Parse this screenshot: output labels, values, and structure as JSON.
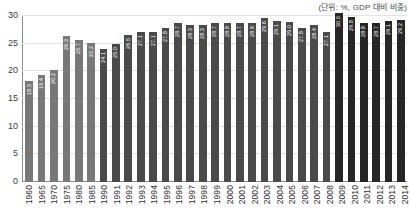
{
  "unit_note": "(단위: %, GDP 대비 비중)",
  "colors": {
    "group_early": "#787878",
    "group_mid": "#4a4a4a",
    "group_late": "#262626",
    "gridline": "#e2e2e2",
    "axis": "#8a8a8a",
    "label_text": "#ffffff",
    "tick_text": "#2e2e2e"
  },
  "chart_data": {
    "type": "bar",
    "title": "",
    "subtitle": "",
    "xlabel": "",
    "ylabel": "",
    "annotation": "(단위: %, GDP 대비 비중)",
    "ylim": [
      0,
      30
    ],
    "y_ticks": [
      0,
      5,
      10,
      15,
      20,
      25,
      30
    ],
    "y_tick_labels": [
      "0",
      "5",
      "10",
      "15",
      "20",
      "25",
      "30"
    ],
    "grid": true,
    "legend": "none",
    "categories": [
      "1960",
      "1965",
      "1970",
      "1975",
      "1980",
      "1985",
      "1990",
      "1991",
      "1992",
      "1993",
      "1994",
      "1995",
      "1996",
      "1997",
      "1998",
      "1999",
      "2000",
      "2001",
      "2002",
      "2003",
      "2004",
      "2005",
      "2006",
      "2007",
      "2008",
      "2009",
      "2010",
      "2011",
      "2012",
      "2013",
      "2014"
    ],
    "values": [
      18.3,
      19.4,
      20.2,
      26.3,
      25.7,
      25.2,
      24.1,
      25.0,
      26.5,
      27.1,
      27.1,
      27.8,
      28.7,
      28.3,
      28.3,
      28.7,
      28.8,
      28.7,
      28.8,
      29.6,
      29.1,
      29.0,
      27.8,
      28.4,
      27.1,
      30.5,
      29.8,
      28.8,
      28.7,
      29.1,
      29.2
    ],
    "value_labels": [
      "18.3",
      "19.4",
      "20.2",
      "26.3",
      "25.7",
      "25.2",
      "24.1",
      "25.0",
      "26.5",
      "27.1",
      "27.1",
      "27.8",
      "28.7",
      "28.3",
      "28.3",
      "28.7",
      "28.8",
      "28.7",
      "28.8",
      "29.6",
      "29.1",
      "29.0",
      "27.8",
      "28.4",
      "27.1",
      "30.5",
      "29.8",
      "28.8",
      "28.7",
      "29.1",
      "29.2"
    ],
    "bar_groups": [
      "early",
      "early",
      "early",
      "early",
      "early",
      "early",
      "mid",
      "mid",
      "mid",
      "mid",
      "mid",
      "mid",
      "mid",
      "mid",
      "mid",
      "mid",
      "mid",
      "mid",
      "mid",
      "mid",
      "mid",
      "mid",
      "mid",
      "mid",
      "mid",
      "late",
      "late",
      "late",
      "late",
      "late",
      "late"
    ]
  }
}
